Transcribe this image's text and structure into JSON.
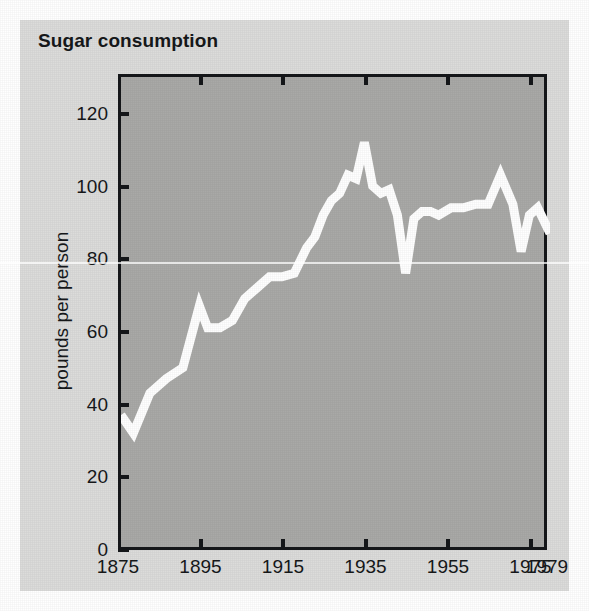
{
  "figure": {
    "title": "Sugar consumption",
    "background_color": "#dcdcda",
    "plot_background_color": "#a9a9a7",
    "line_color": "#ffffff",
    "axis_color": "#15171a"
  },
  "chart_data": {
    "type": "line",
    "title": "Sugar consumption",
    "xlabel": "",
    "ylabel": "pounds per person",
    "xlim": [
      1875,
      1979
    ],
    "ylim": [
      0,
      131
    ],
    "grid": false,
    "legend": null,
    "xticks": [
      1875,
      1895,
      1915,
      1935,
      1955,
      1975,
      1979
    ],
    "xtick_labels": [
      "1875",
      "1895",
      "1915",
      "1935",
      "1955",
      "1975",
      "1979"
    ],
    "yticks": [
      0,
      20,
      40,
      60,
      80,
      100,
      120
    ],
    "ytick_labels": [
      "0",
      "20",
      "40",
      "60",
      "80",
      "100",
      "120"
    ],
    "series": [
      {
        "name": "pounds per person",
        "x": [
          1875,
          1878,
          1882,
          1886,
          1890,
          1894,
          1896,
          1899,
          1902,
          1905,
          1908,
          1911,
          1914,
          1917,
          1920,
          1922,
          1924,
          1926,
          1928,
          1930,
          1932,
          1934,
          1936,
          1938,
          1940,
          1942,
          1944,
          1946,
          1948,
          1950,
          1952,
          1955,
          1958,
          1961,
          1964,
          1967,
          1970,
          1972,
          1974,
          1976,
          1979
        ],
        "y": [
          38,
          33,
          44,
          48,
          51,
          68,
          62,
          62,
          64,
          70,
          73,
          76,
          76,
          77,
          84,
          87,
          93,
          97,
          99,
          104,
          103,
          113,
          101,
          99,
          100,
          93,
          77,
          92,
          94,
          94,
          93,
          95,
          95,
          96,
          96,
          104,
          96,
          83,
          93,
          95,
          88
        ]
      }
    ]
  },
  "axis_titles": {
    "y": "pounds per person"
  }
}
